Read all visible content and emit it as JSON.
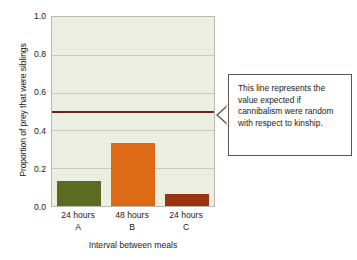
{
  "chart_data": {
    "type": "bar",
    "title": "",
    "subtitle": "",
    "xlabel": "Interval between meals",
    "ylabel": "Proportion of prey that were siblings",
    "categories": [
      "24 hours\nA",
      "48 hours\nB",
      "24 hours\nC"
    ],
    "category_labels": [
      {
        "line1": "24 hours",
        "line2": "A"
      },
      {
        "line1": "48 hours",
        "line2": "B"
      },
      {
        "line1": "24 hours",
        "line2": "C"
      }
    ],
    "values": [
      0.13,
      0.335,
      0.065
    ],
    "bar_colors": [
      "#5c6b21",
      "#dd6b15",
      "#993311"
    ],
    "ylim": [
      0.0,
      1.0
    ],
    "ytick_labels": [
      "1.0",
      "0.8",
      "0.6",
      "0.4",
      "0.2",
      "0.0"
    ],
    "ytick_values": [
      1.0,
      0.8,
      0.6,
      0.4,
      0.2,
      0.0
    ],
    "grid": true,
    "grid_color": "#c9cbbd",
    "legend": null,
    "plot_background": "#edeee2",
    "annotations": [
      {
        "name": "expected-value-line",
        "type": "hline",
        "value": 0.5,
        "color": "#6b2418",
        "label": "This line represents the value expected if cannibalism were random with respect to kinship."
      }
    ]
  },
  "callout": {
    "text": "This line represents the value expected if cannibalism were random with respect to kinship."
  }
}
